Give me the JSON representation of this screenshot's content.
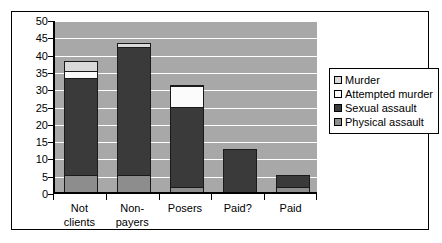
{
  "chart_data": {
    "type": "bar",
    "title": "",
    "xlabel": "",
    "ylabel": "",
    "ylim": [
      0,
      50
    ],
    "ytick_step": 5,
    "yticks": [
      0,
      5,
      10,
      15,
      20,
      25,
      30,
      35,
      40,
      45,
      50
    ],
    "grid": true,
    "stacked": true,
    "legend_position": "right",
    "categories": [
      "Not clients",
      "Non-payers",
      "Posers",
      "Paid?",
      "Paid"
    ],
    "category_lines": [
      [
        "Not",
        "clients"
      ],
      [
        "Non-",
        "payers"
      ],
      [
        "Posers",
        ""
      ],
      [
        "Paid?",
        ""
      ],
      [
        "Paid",
        ""
      ]
    ],
    "series": [
      {
        "name": "Physical assault",
        "color": "#8d8d8d",
        "values": [
          5,
          5,
          1.5,
          0,
          1.5
        ]
      },
      {
        "name": "Sexual assault",
        "color": "#3a3a3a",
        "values": [
          28,
          37,
          23,
          12.5,
          3.5
        ]
      },
      {
        "name": "Attempted murder",
        "color": "#fbfbfb",
        "values": [
          2,
          0,
          6,
          0,
          0
        ]
      },
      {
        "name": "Murder",
        "color": "#d9d9d9",
        "values": [
          3,
          1,
          0.5,
          0,
          0
        ]
      }
    ],
    "totals": [
      38,
      43,
      31,
      12.5,
      5
    ],
    "legend_order": [
      "Murder",
      "Attempted murder",
      "Sexual assault",
      "Physical assault"
    ]
  },
  "colors": {
    "plot_background": "#a8a8a8",
    "gridline": "#ffffff",
    "axis": "#000000",
    "frame": "#000000",
    "page_background": "#ffffff"
  }
}
